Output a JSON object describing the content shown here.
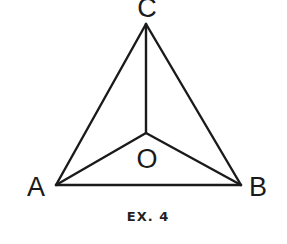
{
  "diagram": {
    "type": "geometry-figure",
    "points": {
      "A": {
        "label": "A",
        "x": 56,
        "y": 185,
        "label_x": 36,
        "label_y": 196
      },
      "B": {
        "label": "B",
        "x": 241,
        "y": 185,
        "label_x": 258,
        "label_y": 196
      },
      "C": {
        "label": "C",
        "x": 146,
        "y": 24,
        "label_x": 147,
        "label_y": 17
      },
      "O": {
        "label": "O",
        "x": 146,
        "y": 133,
        "label_x": 147,
        "label_y": 168
      }
    },
    "segments": [
      {
        "from": "A",
        "to": "B"
      },
      {
        "from": "B",
        "to": "C"
      },
      {
        "from": "C",
        "to": "A"
      },
      {
        "from": "O",
        "to": "A"
      },
      {
        "from": "O",
        "to": "B"
      },
      {
        "from": "O",
        "to": "C"
      }
    ],
    "caption": "EX. 4",
    "colors": {
      "line": "#1a1a1a",
      "text": "#1a1a1a",
      "background": "#ffffff"
    }
  }
}
